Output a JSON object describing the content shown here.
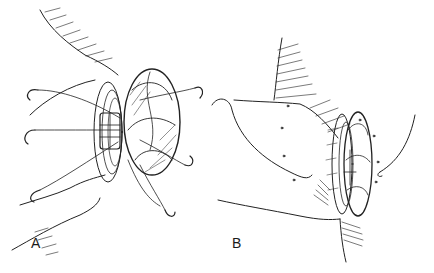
{
  "figure": {
    "type": "surgical line illustration",
    "panels": [
      {
        "id": "A",
        "label": "A"
      },
      {
        "id": "B",
        "label": "B"
      }
    ],
    "colors": {
      "ink": "#222222",
      "background": "#ffffff"
    }
  }
}
